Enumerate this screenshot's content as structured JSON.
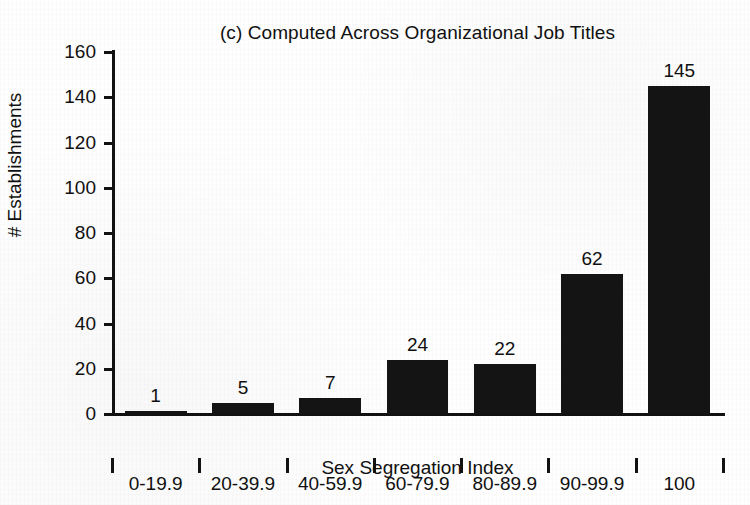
{
  "chart_data": {
    "type": "bar",
    "title": "(c) Computed Across Organizational Job Titles",
    "xlabel": "Sex Segregation Index",
    "ylabel": "# Establishments",
    "categories": [
      "0-19.9",
      "20-39.9",
      "40-59.9",
      "60-79.9",
      "80-89.9",
      "90-99.9",
      "100"
    ],
    "values": [
      1,
      5,
      7,
      24,
      22,
      62,
      145
    ],
    "value_labels": [
      "1",
      "5",
      "7",
      "24",
      "22",
      "62",
      "145"
    ],
    "ylim": [
      0,
      160
    ],
    "ytick_labels": [
      "0",
      "20",
      "40",
      "60",
      "80",
      "100",
      "120",
      "140",
      "160"
    ],
    "ytick_values": [
      0,
      20,
      40,
      60,
      80,
      100,
      120,
      140,
      160
    ],
    "grid": false,
    "legend": false,
    "bar_color": "#141414",
    "background_color": "#fefefe",
    "axis_color": "#121212"
  }
}
